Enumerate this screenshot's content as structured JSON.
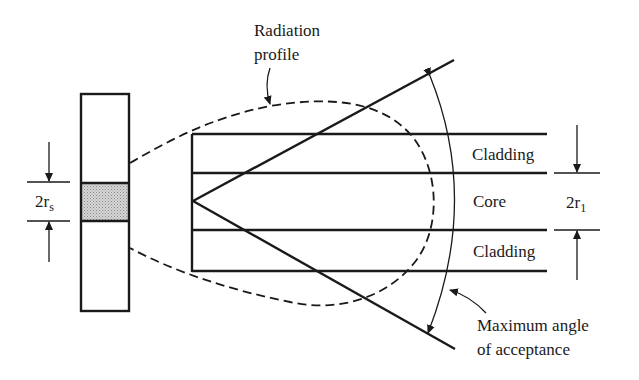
{
  "diagram": {
    "labels": {
      "radiation_profile_line1": "Radiation",
      "radiation_profile_line2": "profile",
      "cladding_top": "Cladding",
      "core": "Core",
      "cladding_bottom": "Cladding",
      "max_angle_line1": "Maximum angle",
      "max_angle_line2": "of acceptance",
      "source_dim_main": "2r",
      "source_dim_sub": "s",
      "core_dim_main": "2r",
      "core_dim_sub": "1"
    },
    "colors": {
      "ink": "#1a1a1a",
      "source_emitting_fill": "#c8c8c8",
      "background": "#ffffff"
    }
  }
}
